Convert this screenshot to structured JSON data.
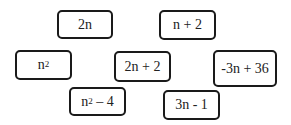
{
  "cards": [
    {
      "id": "2n",
      "base": "2n",
      "sup": "",
      "rest": ""
    },
    {
      "id": "n+2",
      "base": "n + 2",
      "sup": "",
      "rest": ""
    },
    {
      "id": "n^2",
      "base": "n",
      "sup": "2",
      "rest": ""
    },
    {
      "id": "2n+2",
      "base": "2n + 2",
      "sup": "",
      "rest": ""
    },
    {
      "id": "-3n+36",
      "base": "-3n + 36",
      "sup": "",
      "rest": ""
    },
    {
      "id": "n^2-4",
      "base": "n",
      "sup": "2",
      "rest": " – 4"
    },
    {
      "id": "3n-1",
      "base": "3n - 1",
      "sup": "",
      "rest": ""
    }
  ]
}
